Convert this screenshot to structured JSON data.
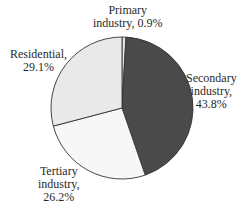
{
  "chart_data": {
    "type": "pie",
    "title": "",
    "slices": [
      {
        "label": "Primary industry",
        "value": 0.9,
        "display": "0.9%",
        "color": "#e6e6e6"
      },
      {
        "label": "Secondary industry",
        "value": 43.8,
        "display": "43.8%",
        "color": "#4a4a4a"
      },
      {
        "label": "Tertiary industry",
        "value": 26.2,
        "display": "26.2%",
        "color": "#f7f7f7"
      },
      {
        "label": "Residential",
        "value": 29.1,
        "display": "29.1%",
        "color": "#e9e9e9"
      }
    ],
    "start_angle": "12 o'clock",
    "direction": "clockwise",
    "legend": "none (direct labels)"
  },
  "labels": {
    "primary": {
      "line1": "Primary",
      "line2": "industry, 0.9%"
    },
    "secondary": {
      "line1": "Secondary",
      "line2": "industry,",
      "line3": "43.8%"
    },
    "tertiary": {
      "line1": "Tertiary",
      "line2": "industry,",
      "line3": "26.2%"
    },
    "residential": {
      "line1": "Residential,",
      "line2": "29.1%"
    }
  }
}
